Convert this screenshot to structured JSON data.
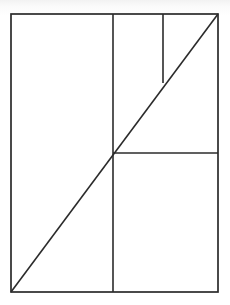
{
  "figure": {
    "background_color": "#ffffff",
    "stroke_color": "#2b2b2b",
    "canvas": {
      "width": 230,
      "height": 305
    },
    "frame": {
      "label": "outer rectangle",
      "x": 11,
      "y": 14,
      "width": 207,
      "height": 278,
      "right": 218,
      "bottom": 292
    },
    "segments": [
      {
        "name": "diagonal",
        "label": "Diagonal from bottom-left corner to top-right corner",
        "x1": 11,
        "y1": 292,
        "x2": 218,
        "y2": 14
      },
      {
        "name": "vertical-main",
        "label": "Full-height vertical line",
        "x1": 113,
        "y1": 14,
        "x2": 113,
        "y2": 292
      },
      {
        "name": "vertical-short",
        "label": "Short vertical line from top edge down to the diagonal",
        "x1": 163,
        "y1": 14,
        "x2": 163,
        "y2": 83
      },
      {
        "name": "horizontal-right",
        "label": "Horizontal line from diagonal-vertical crossing to right edge",
        "x1": 113,
        "y1": 153,
        "x2": 218,
        "y2": 153
      }
    ],
    "vertices": [
      {
        "name": "corner-top-left",
        "x": 11,
        "y": 14
      },
      {
        "name": "corner-top-right",
        "x": 218,
        "y": 14
      },
      {
        "name": "corner-bottom-right",
        "x": 218,
        "y": 292
      },
      {
        "name": "corner-bottom-left",
        "x": 11,
        "y": 292
      },
      {
        "name": "crossing-diagonal-vertical-main",
        "x": 113,
        "y": 153
      },
      {
        "name": "crossing-diagonal-vertical-short",
        "x": 163,
        "y": 83
      }
    ]
  }
}
